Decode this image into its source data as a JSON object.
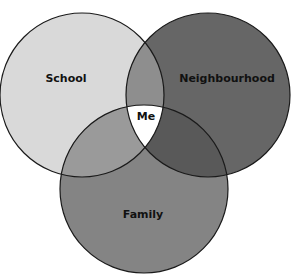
{
  "diagram": {
    "type": "venn",
    "sets": [
      {
        "id": "school",
        "label": "School",
        "color": "#d9d9d9"
      },
      {
        "id": "neighbourhood",
        "label": "Neighbourhood",
        "color": "#666666"
      },
      {
        "id": "family",
        "label": "Family",
        "color": "#848484"
      }
    ],
    "intersections": {
      "school_neighbourhood": "#8e8e8e",
      "school_family": "#9a9a9a",
      "neighbourhood_family": "#595959",
      "center": {
        "label": "Me",
        "color": "#ffffff"
      }
    }
  }
}
